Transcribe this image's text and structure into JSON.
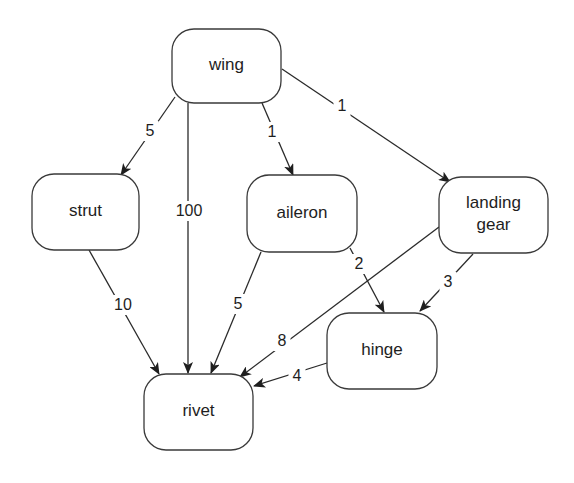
{
  "diagram": {
    "type": "directed weighted graph",
    "colors": {
      "background": "#ffffff",
      "stroke": "#2a2a2a",
      "text": "#1e1e1e"
    },
    "nodes": [
      {
        "id": "wing",
        "lines": [
          "wing"
        ],
        "x": 172,
        "y": 29,
        "w": 109,
        "h": 74
      },
      {
        "id": "strut",
        "lines": [
          "strut"
        ],
        "x": 32,
        "y": 174,
        "w": 107,
        "h": 76
      },
      {
        "id": "aileron",
        "lines": [
          "aileron"
        ],
        "x": 247,
        "y": 175,
        "w": 110,
        "h": 77
      },
      {
        "id": "landing_gear",
        "lines": [
          "landing",
          "gear"
        ],
        "x": 439,
        "y": 177,
        "w": 109,
        "h": 76
      },
      {
        "id": "hinge",
        "lines": [
          "hinge"
        ],
        "x": 327,
        "y": 313,
        "w": 110,
        "h": 76
      },
      {
        "id": "rivet",
        "lines": [
          "rivet"
        ],
        "x": 144,
        "y": 374,
        "w": 109,
        "h": 76
      }
    ],
    "edges": [
      {
        "from": "wing",
        "to": "strut",
        "weight": "5",
        "x1": 175,
        "y1": 97,
        "x2": 121,
        "y2": 175,
        "lx": 150,
        "ly": 131
      },
      {
        "from": "wing",
        "to": "rivet",
        "weight": "100",
        "x1": 188,
        "y1": 103,
        "x2": 188,
        "y2": 373,
        "lx": 189,
        "ly": 211
      },
      {
        "from": "wing",
        "to": "aileron",
        "weight": "1",
        "x1": 262,
        "y1": 103,
        "x2": 293,
        "y2": 175,
        "lx": 272,
        "ly": 132
      },
      {
        "from": "wing",
        "to": "landing_gear",
        "weight": "1",
        "x1": 282,
        "y1": 69,
        "x2": 450,
        "y2": 182,
        "lx": 342,
        "ly": 106
      },
      {
        "from": "strut",
        "to": "rivet",
        "weight": "10",
        "x1": 89,
        "y1": 250,
        "x2": 159,
        "y2": 374,
        "lx": 123,
        "ly": 305
      },
      {
        "from": "aileron",
        "to": "rivet",
        "weight": "5",
        "x1": 261,
        "y1": 252,
        "x2": 211,
        "y2": 373,
        "lx": 238,
        "ly": 304
      },
      {
        "from": "aileron",
        "to": "hinge",
        "weight": "2",
        "x1": 350,
        "y1": 248,
        "x2": 384,
        "y2": 312,
        "lx": 359,
        "ly": 264
      },
      {
        "from": "landing_gear",
        "to": "hinge",
        "weight": "3",
        "x1": 473,
        "y1": 254,
        "x2": 420,
        "y2": 311,
        "lx": 448,
        "ly": 282
      },
      {
        "from": "landing_gear",
        "to": "rivet",
        "weight": "8",
        "x1": 439,
        "y1": 227,
        "x2": 240,
        "y2": 377,
        "lx": 282,
        "ly": 341
      },
      {
        "from": "hinge",
        "to": "rivet",
        "weight": "4",
        "x1": 327,
        "y1": 363,
        "x2": 254,
        "y2": 386,
        "lx": 297,
        "ly": 376
      }
    ]
  }
}
